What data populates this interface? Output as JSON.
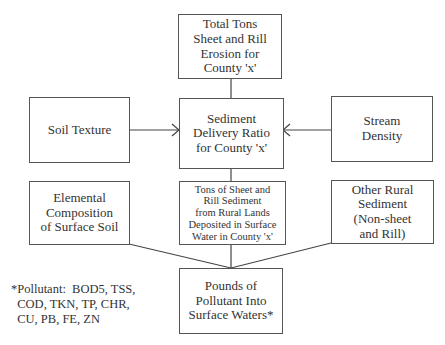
{
  "diagram": {
    "nodes": {
      "total_tons": "Total Tons\nSheet and Rill\nErosion for\nCounty 'x'",
      "soil_texture": "Soil Texture",
      "sdr": "Sediment\nDelivery Ratio\nfor County 'x'",
      "stream_density": "Stream\nDensity",
      "elemental": "Elemental\nComposition\nof Surface Soil",
      "tons_deposited": "Tons of Sheet and\nRill Sediment\nfrom Rural Lands\nDeposited in Surface\nWater in  County 'x'",
      "other_rural": "Other Rural\nSediment\n(Non-sheet\nand Rill)",
      "pounds": "Pounds of\nPollutant Into\nSurface Waters*"
    },
    "edges": [
      {
        "from": "total_tons",
        "to": "sdr"
      },
      {
        "from": "soil_texture",
        "to": "sdr",
        "arrow": true
      },
      {
        "from": "stream_density",
        "to": "sdr",
        "arrow": true
      },
      {
        "from": "sdr",
        "to": "tons_deposited"
      },
      {
        "from": "elemental",
        "to": "pounds"
      },
      {
        "from": "tons_deposited",
        "to": "pounds"
      },
      {
        "from": "other_rural",
        "to": "pounds"
      }
    ],
    "footnote": "*Pollutant:  BOD5, TSS,\n  COD, TKN, TP, CHR,\n  CU, PB, FE, ZN"
  }
}
